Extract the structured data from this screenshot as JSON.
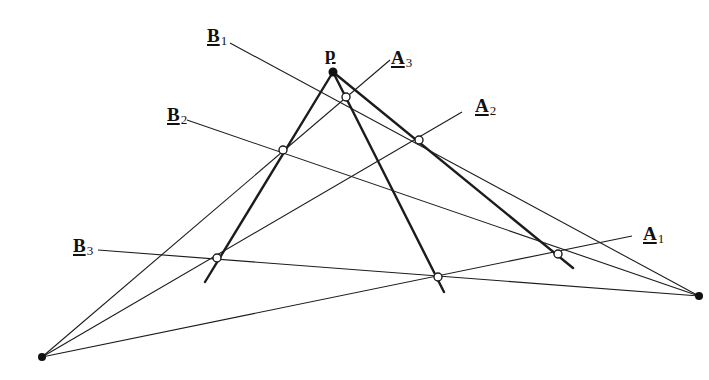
{
  "diagram": {
    "labels": {
      "P": {
        "main": "p",
        "sub": ""
      },
      "A1": {
        "main": "A",
        "sub": "1"
      },
      "A2": {
        "main": "A",
        "sub": "2"
      },
      "A3": {
        "main": "A",
        "sub": "3"
      },
      "B1": {
        "main": "B",
        "sub": "1"
      },
      "B2": {
        "main": "B",
        "sub": "2"
      },
      "B3": {
        "main": "B",
        "sub": "3"
      }
    },
    "colors": {
      "ink": "#1c1c1c",
      "background": "#ffffff"
    },
    "points": {
      "P": [
        333,
        72
      ],
      "L": [
        42,
        357
      ],
      "R": [
        699,
        296
      ],
      "X_A3_B1": [
        346,
        97
      ],
      "X_A2_B1": [
        419,
        140
      ],
      "X_A3_B2": [
        283,
        150
      ],
      "X_A2_B3": [
        217,
        258
      ],
      "X_A1_B2": [
        558,
        254
      ],
      "X_A1_B3": [
        438,
        277
      ]
    }
  }
}
